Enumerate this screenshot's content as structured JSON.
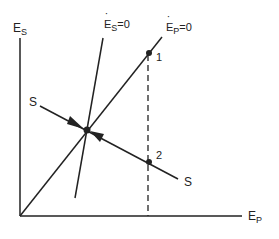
{
  "axes": {
    "y_label": {
      "main": "E",
      "sub": "S"
    },
    "x_label": {
      "main": "E",
      "sub": "P"
    }
  },
  "curves": {
    "es_nullcline": {
      "main": "E",
      "sub": "S",
      "eq": "=0"
    },
    "ep_nullcline": {
      "main": "E",
      "sub": "P",
      "eq": "=0"
    },
    "s_line_left": "S",
    "s_line_right": "S"
  },
  "points": {
    "p1": "1",
    "p2": "2"
  },
  "colors": {
    "line": "#222222",
    "background": "#ffffff"
  }
}
